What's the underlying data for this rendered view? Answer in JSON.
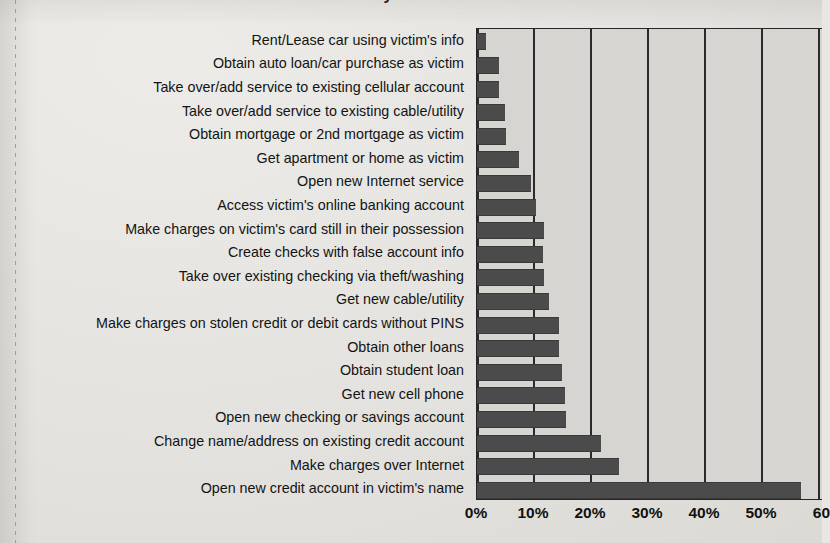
{
  "chart_data": {
    "type": "bar",
    "orientation": "horizontal",
    "title": "Identity Information",
    "xlabel": "",
    "ylabel": "",
    "xlim": [
      0,
      61
    ],
    "grid": true,
    "legend": false,
    "xticks": [
      "0%",
      "10%",
      "20%",
      "30%",
      "40%",
      "50%",
      "60"
    ],
    "xtick_values": [
      0,
      10,
      20,
      30,
      40,
      50,
      60
    ],
    "categories": [
      "Rent/Lease car using victim's info",
      "Obtain auto loan/car purchase as victim",
      "Take over/add service to existing cellular account",
      "Take over/add service to existing cable/utility",
      "Obtain mortgage or 2nd mortgage as victim",
      "Get apartment or home as victim",
      "Open new Internet service",
      "Access victim's online banking account",
      "Make charges on victim's card still in their possession",
      "Create checks with false account info",
      "Take over existing checking via theft/washing",
      "Get new cable/utility",
      "Make charges on stolen credit or debit cards without PINS",
      "Obtain other loans",
      "Obtain student loan",
      "Get new cell phone",
      "Open new checking or savings account",
      "Change name/address on existing credit account",
      "Make charges over Internet",
      "Open new credit account in victim's name"
    ],
    "values": [
      1.6,
      3.9,
      3.9,
      4.9,
      5.0,
      7.4,
      9.5,
      10.4,
      11.8,
      11.6,
      11.8,
      12.6,
      14.4,
      14.3,
      14.9,
      15.4,
      15.7,
      21.8,
      24.9,
      56.8
    ],
    "bar_color": "#4b4b4b",
    "plot_background": "#d6d5d1",
    "axis_color": "#262626"
  }
}
